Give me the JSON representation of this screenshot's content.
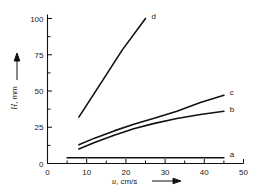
{
  "chart_data": {
    "type": "line",
    "title": "",
    "subtitle": "",
    "xlabel": "u, cm/s",
    "ylabel": "H, mm",
    "xlim": [
      0,
      50
    ],
    "ylim": [
      0,
      100
    ],
    "grid": false,
    "legend_position": "inline-right-end-labels",
    "x_ticks_major": [
      0,
      10,
      20,
      30,
      40,
      50
    ],
    "x_ticks_minor": [
      5,
      15,
      25,
      35,
      45
    ],
    "x_tick_labels": [
      "0",
      "10",
      "20",
      "30",
      "40",
      "50"
    ],
    "y_ticks_major": [
      0,
      25,
      50,
      75,
      100
    ],
    "y_ticks_minor": [
      12.5,
      37.5,
      62.5,
      87.5
    ],
    "y_tick_labels": [
      "0",
      "25",
      "50",
      "75",
      "100"
    ],
    "series": [
      {
        "name": "a",
        "label": "a",
        "x": [
          5,
          15,
          25,
          35,
          45
        ],
        "values": [
          4,
          4,
          4,
          4,
          4
        ],
        "label_x": 46.5,
        "label_y": 6.5
      },
      {
        "name": "b",
        "label": "b",
        "x": [
          8,
          12,
          17,
          22,
          27,
          33,
          39,
          45
        ],
        "values": [
          10,
          14.5,
          19.5,
          24,
          27.5,
          31,
          33.8,
          36
        ],
        "label_x": 46.5,
        "label_y": 37.5
      },
      {
        "name": "c",
        "label": "c",
        "x": [
          8,
          12,
          17,
          22,
          27,
          33,
          39,
          45
        ],
        "values": [
          13,
          17.5,
          22.5,
          27,
          31,
          36,
          42,
          47
        ],
        "label_x": 46.5,
        "label_y": 49
      },
      {
        "name": "d",
        "label": "d",
        "x": [
          8,
          14,
          19,
          25
        ],
        "values": [
          32,
          57,
          78,
          100
        ],
        "label_x": 26.5,
        "label_y": 102
      }
    ]
  },
  "axes": {
    "x_axis_label_text": "u, cm/s",
    "y_axis_label_text": "H, mm",
    "x_axis_arrow": "right-arrow",
    "y_axis_arrow": "up-arrow"
  }
}
